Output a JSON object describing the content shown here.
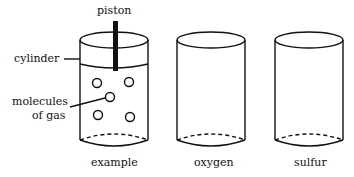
{
  "labels": {
    "piston": "piston",
    "cylinder": "cylinder",
    "molecules_line1": "molecules",
    "molecules_line2": "of gas"
  },
  "cylinders": [
    {
      "caption": "example",
      "has_piston": true,
      "molecule_count": 5
    },
    {
      "caption": "oxygen",
      "has_piston": false,
      "molecule_count": 0
    },
    {
      "caption": "sulfur",
      "has_piston": false,
      "molecule_count": 0
    }
  ]
}
